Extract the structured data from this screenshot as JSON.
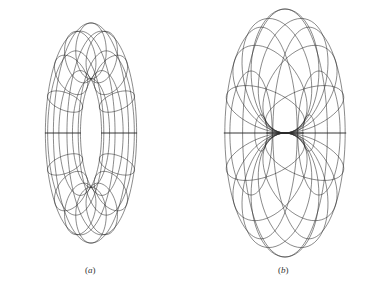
{
  "figure": {
    "background": "#ffffff",
    "stroke_color": "#2a2a2a",
    "panels": [
      {
        "id": "a",
        "caption": "(a)",
        "caption_letter": "a",
        "description": "Wireframe ring torus viewed obliquely",
        "center": [
          91,
          133
        ],
        "major_radius": 53,
        "minor_radius": 18,
        "tilt_deg": 58,
        "meridians": 16,
        "parallels": 8,
        "caption_pos": [
          85,
          265
        ]
      },
      {
        "id": "b",
        "caption": "(b)",
        "caption_letter": "b",
        "description": "Wireframe horn-like torus viewed obliquely with pinched inner equator",
        "center": [
          285,
          133
        ],
        "major_radius": 40,
        "minor_radius": 40,
        "tilt_deg": 58,
        "meridians": 16,
        "parallels": 8,
        "caption_pos": [
          278,
          265
        ]
      }
    ]
  }
}
